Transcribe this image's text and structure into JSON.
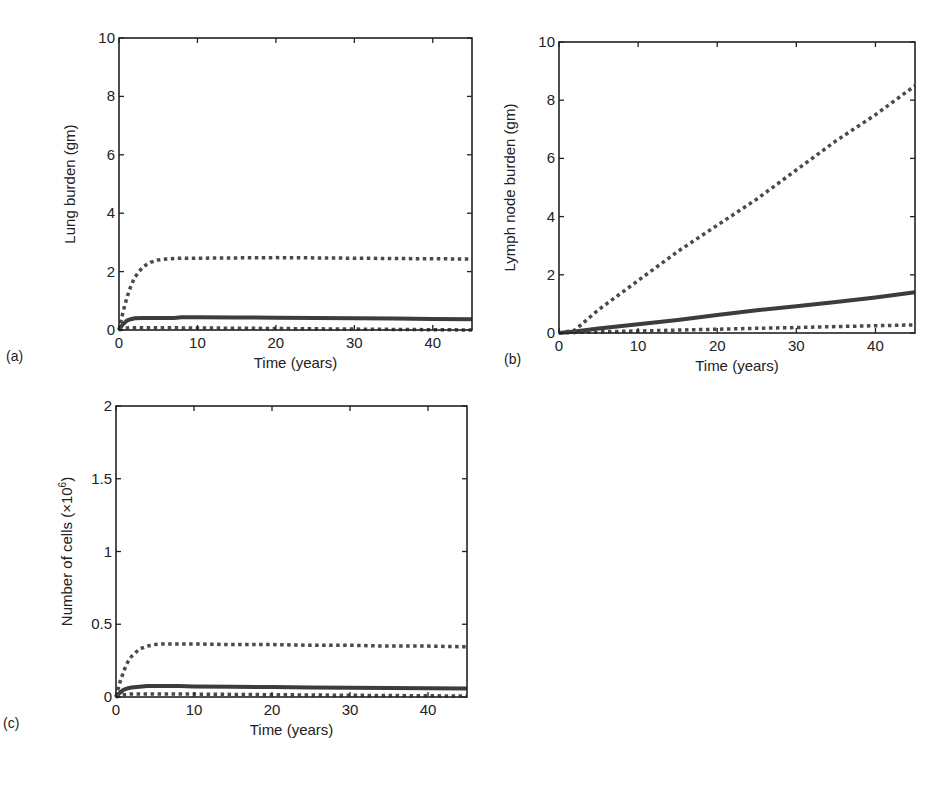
{
  "chart_data": [
    {
      "id": "a",
      "panel_label": "(a)",
      "type": "line",
      "title": "",
      "xlabel": "Time (years)",
      "ylabel": "Lung burden (gm)",
      "xlim": [
        0,
        45
      ],
      "ylim": [
        0,
        10
      ],
      "xticks": [
        0,
        10,
        20,
        30,
        40
      ],
      "yticks": [
        0,
        2,
        4,
        6,
        8,
        10
      ],
      "grid": false,
      "legend": null,
      "frame": {
        "left": 119,
        "top": 38,
        "right": 472,
        "bottom": 330
      },
      "x": [
        0,
        0.5,
        1,
        1.5,
        2,
        3,
        4,
        5,
        6,
        7,
        8,
        10,
        15,
        20,
        25,
        30,
        35,
        40,
        45
      ],
      "series": [
        {
          "name": "upper dotted",
          "style": "dotted",
          "values": [
            0,
            0.6,
            1.1,
            1.5,
            1.8,
            2.15,
            2.32,
            2.4,
            2.43,
            2.45,
            2.46,
            2.46,
            2.47,
            2.48,
            2.47,
            2.46,
            2.45,
            2.44,
            2.43
          ]
        },
        {
          "name": "solid",
          "style": "solid",
          "values": [
            0,
            0.2,
            0.32,
            0.37,
            0.4,
            0.41,
            0.41,
            0.41,
            0.41,
            0.41,
            0.44,
            0.44,
            0.43,
            0.42,
            0.41,
            0.4,
            0.39,
            0.38,
            0.37
          ]
        },
        {
          "name": "lower dotted",
          "style": "dotted",
          "values": [
            0,
            0.05,
            0.07,
            0.08,
            0.08,
            0.08,
            0.08,
            0.08,
            0.08,
            0.08,
            0.07,
            0.07,
            0.06,
            0.05,
            0.04,
            0.03,
            0.02,
            0.01,
            0.0
          ]
        }
      ]
    },
    {
      "id": "b",
      "panel_label": "(b)",
      "type": "line",
      "title": "",
      "xlabel": "Time (years)",
      "ylabel": "Lymph node burden (gm)",
      "xlim": [
        0,
        45
      ],
      "ylim": [
        0,
        10
      ],
      "xticks": [
        0,
        10,
        20,
        30,
        40
      ],
      "yticks": [
        0,
        2,
        4,
        6,
        8,
        10
      ],
      "grid": false,
      "legend": null,
      "frame": {
        "left": 559,
        "top": 42,
        "right": 915,
        "bottom": 333
      },
      "x": [
        0,
        2,
        5,
        10,
        15,
        20,
        25,
        30,
        35,
        40,
        45
      ],
      "series": [
        {
          "name": "upper dotted",
          "style": "dotted",
          "values": [
            0,
            0.1,
            0.8,
            1.8,
            2.8,
            3.7,
            4.6,
            5.6,
            6.6,
            7.5,
            8.5
          ]
        },
        {
          "name": "solid",
          "style": "solid",
          "values": [
            0,
            0.05,
            0.15,
            0.3,
            0.45,
            0.62,
            0.78,
            0.92,
            1.07,
            1.22,
            1.4
          ]
        },
        {
          "name": "lower dotted",
          "style": "dotted",
          "values": [
            0,
            0.02,
            0.04,
            0.07,
            0.1,
            0.13,
            0.16,
            0.19,
            0.22,
            0.25,
            0.28
          ]
        }
      ]
    },
    {
      "id": "c",
      "panel_label": "(c)",
      "type": "line",
      "title": "",
      "xlabel": "Time (years)",
      "ylabel": "Number of cells (×10",
      "ylabel_sup": "6",
      "ylabel_close": ")",
      "xlim": [
        0,
        45
      ],
      "ylim": [
        0,
        2
      ],
      "xticks": [
        0,
        10,
        20,
        30,
        40
      ],
      "yticks": [
        0,
        0.5,
        1,
        1.5,
        2
      ],
      "yticklabels": [
        "0",
        "0.5",
        "1",
        "1.5",
        "2"
      ],
      "grid": false,
      "legend": null,
      "frame": {
        "left": 116,
        "top": 406,
        "right": 467,
        "bottom": 697
      },
      "x": [
        0,
        0.5,
        1,
        1.5,
        2,
        3,
        4,
        5,
        6,
        8,
        10,
        15,
        20,
        25,
        30,
        35,
        40,
        45
      ],
      "series": [
        {
          "name": "upper dotted",
          "style": "dotted",
          "values": [
            0,
            0.1,
            0.18,
            0.24,
            0.28,
            0.33,
            0.35,
            0.36,
            0.365,
            0.365,
            0.365,
            0.36,
            0.36,
            0.355,
            0.355,
            0.35,
            0.35,
            0.345
          ]
        },
        {
          "name": "solid",
          "style": "solid",
          "values": [
            0,
            0.03,
            0.05,
            0.06,
            0.065,
            0.07,
            0.075,
            0.075,
            0.075,
            0.075,
            0.072,
            0.07,
            0.068,
            0.066,
            0.064,
            0.062,
            0.06,
            0.058
          ]
        },
        {
          "name": "lower dotted",
          "style": "dotted",
          "values": [
            0,
            0.01,
            0.015,
            0.02,
            0.02,
            0.02,
            0.02,
            0.02,
            0.02,
            0.02,
            0.02,
            0.018,
            0.016,
            0.014,
            0.012,
            0.01,
            0.008,
            0.006
          ]
        }
      ]
    }
  ]
}
